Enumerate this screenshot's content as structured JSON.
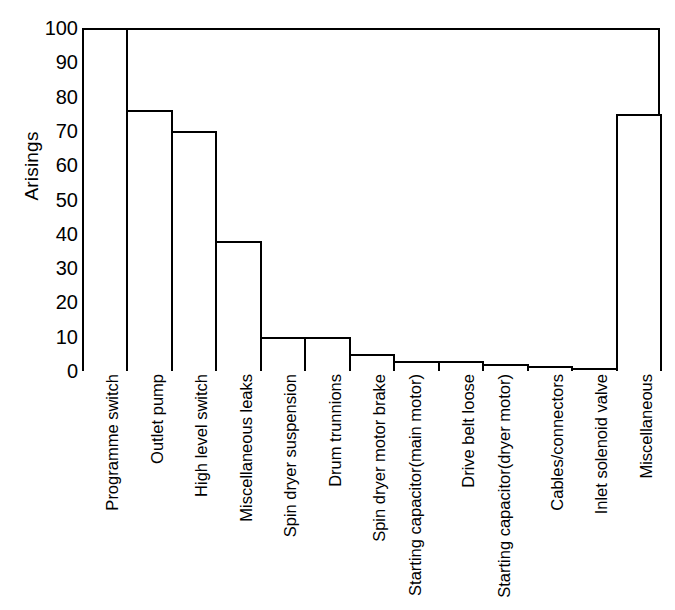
{
  "chart_data": {
    "type": "bar",
    "title": "",
    "xlabel": "",
    "ylabel": "Arisings",
    "ylim": [
      0,
      100
    ],
    "yticks": [
      0,
      10,
      20,
      30,
      40,
      50,
      60,
      70,
      80,
      90,
      100
    ],
    "grid": false,
    "legend": null,
    "orientation": "vertical",
    "bar_style": {
      "fill": "#ffffff",
      "edge": "#000000"
    },
    "categories": [
      "Programme switch",
      "Outlet pump",
      "High level switch",
      "Miscellaneous leaks",
      "Spin dryer suspension",
      "Drum trunnions",
      "Spin dryer motor brake",
      "Starting capacitor (main motor)",
      "Drive belt loose",
      "Starting capacitor (dryer motor)",
      "Cables/connectors",
      "Inlet solenoid valve",
      "Miscellaneous"
    ],
    "category_lines": [
      [
        "Programme switch"
      ],
      [
        "Outlet pump"
      ],
      [
        "High level switch"
      ],
      [
        "Miscellaneous leaks"
      ],
      [
        "Spin dryer suspension"
      ],
      [
        "Drum trunnions"
      ],
      [
        "Spin dryer motor brake"
      ],
      [
        "Starting capacitor",
        "(main motor)"
      ],
      [
        "Drive belt loose"
      ],
      [
        "Starting capacitor",
        "(dryer motor)"
      ],
      [
        "Cables/connectors"
      ],
      [
        "Inlet solenoid valve"
      ],
      [
        "Miscellaneous"
      ]
    ],
    "values": [
      100,
      76,
      70,
      38,
      10,
      10,
      5,
      3,
      3,
      2,
      1.5,
      1,
      75
    ]
  },
  "axis": {
    "y_title": "Arisings",
    "y_tick_labels": [
      "100",
      "90",
      "80",
      "70",
      "60",
      "50",
      "40",
      "30",
      "20",
      "10",
      "0"
    ]
  }
}
